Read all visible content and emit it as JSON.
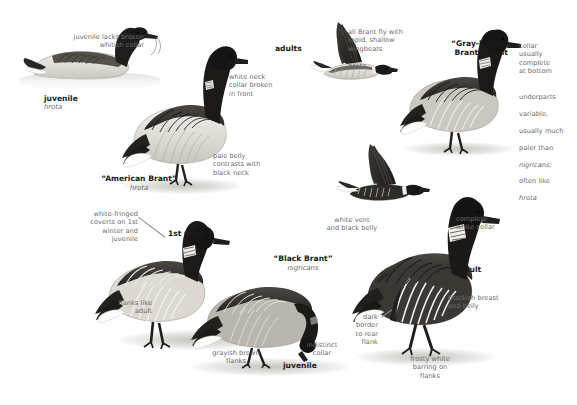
{
  "plate": {
    "title": "Brant identification plate",
    "background_color": "#ffffff",
    "text_color": "#6b6b6b",
    "heading_color": "#1a1a1a"
  },
  "labels": {
    "juvenile_collar_note": "juvenile lacks broken\nwhitish collar",
    "juvenile_name": "juvenile",
    "juvenile_sci": "hrota",
    "white_neck_collar_note": "white neck\ncollar broken\nin front",
    "american_brant_name": "“American Brant”",
    "american_brant_sci": "hrota",
    "pale_belly_note": "pale belly\ncontrasts with\nblack neck",
    "adults_name": "adults",
    "wingbeats_note": "all Brant fly with\nrapid, shallow\nwingbeats",
    "flying_hrota_sci": "hrota",
    "gray_bellied_name": "“Gray-bellied\nBrant” adult",
    "collar_complete_note": "collar\nusually\ncomplete\nat bottom",
    "underparts_note_1": "underparts",
    "underparts_note_2": "variable,",
    "underparts_note_3": "usually much",
    "underparts_note_4": "paler than",
    "underparts_note_5": "nigricans;",
    "underparts_note_6": "often like",
    "underparts_note_7": "hrota",
    "white_vent_note": "white vent\nand black belly",
    "complete_collar_note": "complete\nwhite collar",
    "adult_name": "adult",
    "blackish_breast_note": "blackish breast\nand belly",
    "frosty_barring_note": "frosty white\nbarring on\nflanks",
    "dark_border_note": "dark\nborder\nto rear\nflank",
    "white_fringed_note": "white-fringed\ncoverts on 1st\nwinter and\njuvenile",
    "first_winter_name": "1st winter",
    "flanks_like_adult_note": "flanks like\nadult",
    "black_brant_name": "“Black Brant”",
    "black_brant_sci": "nigricans",
    "grayish_brown_note": "grayish brown\nflanks",
    "indistinct_collar_note": "indistinct\ncollar",
    "juvenile_name_2": "juvenile"
  },
  "figures": [
    {
      "id": "juvenile-swimming",
      "label": "juvenile hrota swimming",
      "pose": "swimming"
    },
    {
      "id": "american-brant-standing",
      "label": "American Brant hrota adult standing",
      "pose": "standing"
    },
    {
      "id": "adults-flying-hrota",
      "label": "hrota adults in flight",
      "pose": "flying"
    },
    {
      "id": "gray-bellied-standing",
      "label": "Gray-bellied Brant adult standing",
      "pose": "standing"
    },
    {
      "id": "nigricans-flying",
      "label": "Black Brant in flight",
      "pose": "flying"
    },
    {
      "id": "first-winter-standing",
      "label": "1st winter Black Brant standing",
      "pose": "standing"
    },
    {
      "id": "juvenile-feeding",
      "label": "juvenile Black Brant feeding",
      "pose": "feeding"
    },
    {
      "id": "adult-standing",
      "label": "adult Black Brant standing",
      "pose": "standing"
    }
  ]
}
